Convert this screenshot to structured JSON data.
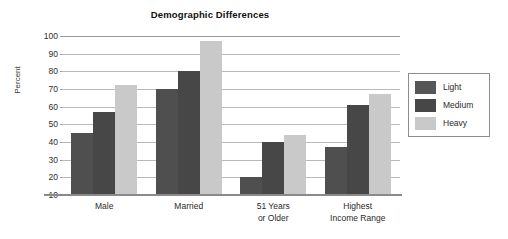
{
  "chart_data": {
    "type": "bar",
    "title": "Demographic Differences",
    "xlabel": "",
    "ylabel": "Percent",
    "ylim": [
      10,
      100
    ],
    "yticks": [
      10,
      20,
      30,
      40,
      50,
      60,
      70,
      80,
      90,
      100
    ],
    "grid": true,
    "legend_position": "right",
    "categories": [
      "Male",
      "Married",
      "51 Years or Older",
      "Highest Income Range"
    ],
    "category_lines": [
      [
        "Male",
        ""
      ],
      [
        "Married",
        ""
      ],
      [
        "51 Years",
        "or Older"
      ],
      [
        "Highest",
        "Income Range"
      ]
    ],
    "series": [
      {
        "name": "Light",
        "color": "#4f4f4f",
        "values": [
          45,
          70,
          20,
          37
        ]
      },
      {
        "name": "Medium",
        "color": "#474747",
        "values": [
          57,
          80,
          40,
          61
        ]
      },
      {
        "name": "Heavy",
        "color": "#c9c9c9",
        "values": [
          72,
          97,
          44,
          67
        ]
      }
    ]
  }
}
